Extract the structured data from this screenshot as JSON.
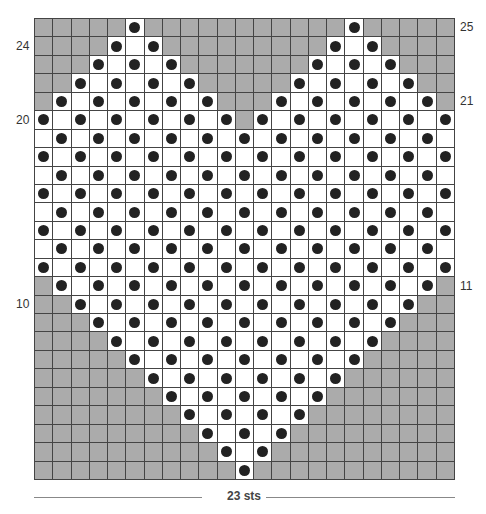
{
  "chart_meta": {
    "title_cut_off": true,
    "columns": 23,
    "rows": 25,
    "width_label": "23 sts",
    "row_labels_left": [
      {
        "row": 24,
        "text": "24"
      },
      {
        "row": 20,
        "text": "20"
      },
      {
        "row": 10,
        "text": "10"
      }
    ],
    "row_labels_right": [
      {
        "row": 25,
        "text": "25"
      },
      {
        "row": 21,
        "text": "21"
      },
      {
        "row": 11,
        "text": "11"
      }
    ],
    "colors": {
      "shaded": "#ababab",
      "open": "#ffffff",
      "dot": "#222222",
      "grid_line": "#444444"
    }
  },
  "legend_semantics": {
    "shaded": "no stitch / background",
    "white": "stitch",
    "dot": "dot stitch"
  },
  "pattern_rows": [
    {
      "row": 25,
      "white": [
        [
          6,
          6
        ],
        [
          18,
          18
        ]
      ],
      "dots": [
        6,
        18
      ]
    },
    {
      "row": 24,
      "white": [
        [
          5,
          7
        ],
        [
          17,
          19
        ]
      ],
      "dots": [
        5,
        7,
        17,
        19
      ]
    },
    {
      "row": 23,
      "white": [
        [
          4,
          8
        ],
        [
          16,
          20
        ]
      ],
      "dots": [
        4,
        6,
        8,
        16,
        18,
        20
      ]
    },
    {
      "row": 22,
      "white": [
        [
          3,
          9
        ],
        [
          15,
          21
        ]
      ],
      "dots": [
        3,
        5,
        7,
        9,
        15,
        17,
        19,
        21
      ]
    },
    {
      "row": 21,
      "white": [
        [
          2,
          10
        ],
        [
          14,
          22
        ]
      ],
      "dots": [
        2,
        4,
        6,
        8,
        10,
        14,
        16,
        18,
        20,
        22
      ]
    },
    {
      "row": 20,
      "white": [
        [
          1,
          11
        ],
        [
          13,
          23
        ]
      ],
      "dots": [
        1,
        3,
        5,
        7,
        9,
        11,
        13,
        15,
        17,
        19,
        21,
        23
      ]
    },
    {
      "row": 19,
      "white": [
        [
          1,
          23
        ]
      ],
      "dots": [
        2,
        4,
        6,
        8,
        10,
        12,
        14,
        16,
        18,
        20,
        22
      ]
    },
    {
      "row": 18,
      "white": [
        [
          1,
          23
        ]
      ],
      "dots": [
        1,
        3,
        5,
        7,
        9,
        11,
        13,
        15,
        17,
        19,
        21,
        23
      ]
    },
    {
      "row": 17,
      "white": [
        [
          1,
          23
        ]
      ],
      "dots": [
        2,
        4,
        6,
        8,
        10,
        12,
        14,
        16,
        18,
        20,
        22
      ]
    },
    {
      "row": 16,
      "white": [
        [
          1,
          23
        ]
      ],
      "dots": [
        1,
        3,
        5,
        7,
        9,
        11,
        13,
        15,
        17,
        19,
        21,
        23
      ]
    },
    {
      "row": 15,
      "white": [
        [
          1,
          23
        ]
      ],
      "dots": [
        2,
        4,
        6,
        8,
        10,
        12,
        14,
        16,
        18,
        20,
        22
      ]
    },
    {
      "row": 14,
      "white": [
        [
          1,
          23
        ]
      ],
      "dots": [
        1,
        3,
        5,
        7,
        9,
        11,
        13,
        15,
        17,
        19,
        21,
        23
      ]
    },
    {
      "row": 13,
      "white": [
        [
          1,
          23
        ]
      ],
      "dots": [
        2,
        4,
        6,
        8,
        10,
        12,
        14,
        16,
        18,
        20,
        22
      ]
    },
    {
      "row": 12,
      "white": [
        [
          1,
          23
        ]
      ],
      "dots": [
        1,
        3,
        5,
        7,
        9,
        11,
        13,
        15,
        17,
        19,
        21,
        23
      ]
    },
    {
      "row": 11,
      "white": [
        [
          2,
          22
        ]
      ],
      "dots": [
        2,
        4,
        6,
        8,
        10,
        12,
        14,
        16,
        18,
        20,
        22
      ]
    },
    {
      "row": 10,
      "white": [
        [
          3,
          21
        ]
      ],
      "dots": [
        3,
        5,
        7,
        9,
        11,
        13,
        15,
        17,
        19,
        21
      ]
    },
    {
      "row": 9,
      "white": [
        [
          4,
          20
        ]
      ],
      "dots": [
        4,
        6,
        8,
        10,
        12,
        14,
        16,
        18,
        20
      ]
    },
    {
      "row": 8,
      "white": [
        [
          5,
          19
        ]
      ],
      "dots": [
        5,
        7,
        9,
        11,
        13,
        15,
        17,
        19
      ]
    },
    {
      "row": 7,
      "white": [
        [
          6,
          18
        ]
      ],
      "dots": [
        6,
        8,
        10,
        12,
        14,
        16,
        18
      ]
    },
    {
      "row": 6,
      "white": [
        [
          7,
          17
        ]
      ],
      "dots": [
        7,
        9,
        11,
        13,
        15,
        17
      ]
    },
    {
      "row": 5,
      "white": [
        [
          8,
          16
        ]
      ],
      "dots": [
        8,
        10,
        12,
        14,
        16
      ]
    },
    {
      "row": 4,
      "white": [
        [
          9,
          15
        ]
      ],
      "dots": [
        9,
        11,
        13,
        15
      ]
    },
    {
      "row": 3,
      "white": [
        [
          10,
          14
        ]
      ],
      "dots": [
        10,
        12,
        14
      ]
    },
    {
      "row": 2,
      "white": [
        [
          11,
          13
        ]
      ],
      "dots": [
        11,
        13
      ]
    },
    {
      "row": 1,
      "white": [
        [
          12,
          12
        ]
      ],
      "dots": [
        12
      ]
    }
  ]
}
